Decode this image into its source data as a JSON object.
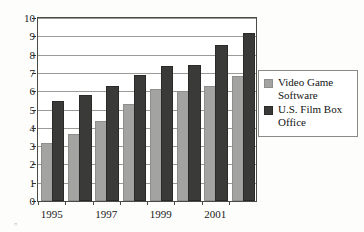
{
  "chart_data": {
    "type": "bar",
    "title": "",
    "xlabel": "",
    "ylabel": "",
    "categories": [
      "1995",
      "1996",
      "1997",
      "1998",
      "1999",
      "2000",
      "2001",
      "2002"
    ],
    "visible_tick_labels": [
      "1995",
      "",
      "1997",
      "",
      "1999",
      "",
      "2001",
      ""
    ],
    "series": [
      {
        "name": "Video Game Software",
        "color": "#a3a3a1",
        "values": [
          3.05,
          3.55,
          4.25,
          5.2,
          6.0,
          5.9,
          6.15,
          6.7
        ]
      },
      {
        "name": "U.S. Film Box Office",
        "color": "#3a3a38",
        "values": [
          5.35,
          5.7,
          6.15,
          6.75,
          7.25,
          7.35,
          8.4,
          9.05
        ]
      }
    ],
    "ylim": [
      0,
      10
    ],
    "ytick_labels": [
      "0",
      "1",
      "2",
      "3",
      "4",
      "5",
      "6",
      "7",
      "8",
      "9",
      "10"
    ],
    "grid": true,
    "grid_axis": "y",
    "legend_position": "right"
  },
  "legend": {
    "entries": [
      {
        "label": "Video Game Software",
        "swatch": "gray-square-icon"
      },
      {
        "label": "U.S. Film Box Office",
        "swatch": "dark-square-icon"
      }
    ]
  },
  "artifact": {
    "glyph": "▫"
  }
}
